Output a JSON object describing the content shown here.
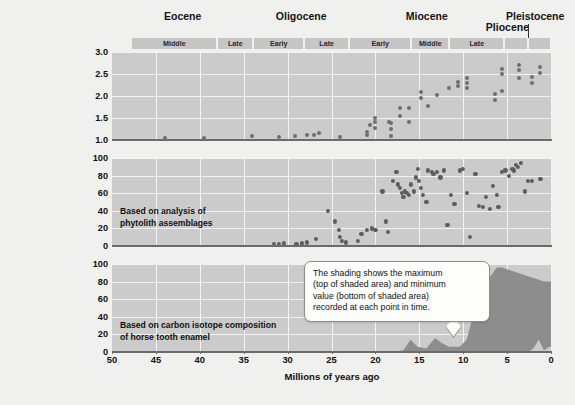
{
  "figure": {
    "xlabel": "Millions of years ago",
    "xticks": [
      "50",
      "45",
      "40",
      "35",
      "30",
      "25",
      "20",
      "15",
      "10",
      "5",
      "0"
    ],
    "xlim": [
      50,
      0
    ]
  },
  "timeline": {
    "epochs": [
      {
        "name": "Eocene",
        "start": 50,
        "end": 33.9
      },
      {
        "name": "Oligocene",
        "start": 33.9,
        "end": 23.0
      },
      {
        "name": "Miocene",
        "start": 23.0,
        "end": 5.3
      },
      {
        "name": "Pliocene",
        "start": 5.3,
        "end": 2.6
      },
      {
        "name": "Pleistocene",
        "start": 2.6,
        "end": 0
      }
    ],
    "subepochs": [
      {
        "label": "Middle",
        "start": 47.8,
        "end": 38.0
      },
      {
        "label": "Late",
        "start": 38.0,
        "end": 33.9
      },
      {
        "label": "Early",
        "start": 33.9,
        "end": 28.1
      },
      {
        "label": "Late",
        "start": 28.1,
        "end": 23.0
      },
      {
        "label": "Early",
        "start": 23.0,
        "end": 15.9
      },
      {
        "label": "Middle",
        "start": 15.9,
        "end": 11.6
      },
      {
        "label": "Late",
        "start": 11.6,
        "end": 5.3
      },
      {
        "label": "",
        "start": 5.3,
        "end": 2.6
      },
      {
        "label": "",
        "start": 2.6,
        "end": 0
      }
    ]
  },
  "callout": {
    "text": "The shading shows the maximum\n(top of shaded area) and minimum\nvalue (bottom of shaded area)\nrecorded at each point in time."
  },
  "chart_data": [
    {
      "type": "scatter",
      "id": "hypsodonty",
      "title": "",
      "ylabel": "Relative importance\nof high-crowned teeth",
      "xlabel": "Millions of years ago",
      "yticks": [
        "1.0",
        "1.5",
        "2.0",
        "2.5",
        "3.0"
      ],
      "ylim": [
        1.0,
        3.0
      ],
      "xlim": [
        50,
        0
      ],
      "grid": true,
      "points": [
        [
          44.0,
          1.05
        ],
        [
          39.5,
          1.05
        ],
        [
          34.0,
          1.08
        ],
        [
          31.0,
          1.07
        ],
        [
          29.2,
          1.1
        ],
        [
          27.8,
          1.12
        ],
        [
          27.0,
          1.12
        ],
        [
          26.4,
          1.15
        ],
        [
          24.0,
          1.07
        ],
        [
          20.6,
          1.35
        ],
        [
          18.4,
          1.42
        ],
        [
          21.0,
          1.12
        ],
        [
          21.0,
          1.18
        ],
        [
          20.0,
          1.5
        ],
        [
          20.0,
          1.4
        ],
        [
          20.0,
          1.28
        ],
        [
          18.2,
          1.1
        ],
        [
          18.2,
          1.25
        ],
        [
          18.2,
          1.38
        ],
        [
          17.2,
          1.55
        ],
        [
          17.2,
          1.72
        ],
        [
          16.2,
          1.42
        ],
        [
          16.2,
          1.72
        ],
        [
          14.8,
          1.95
        ],
        [
          14.8,
          2.1
        ],
        [
          14.0,
          1.78
        ],
        [
          13.0,
          2.02
        ],
        [
          11.6,
          2.18
        ],
        [
          10.6,
          2.22
        ],
        [
          10.6,
          2.32
        ],
        [
          9.6,
          2.18
        ],
        [
          9.6,
          2.3
        ],
        [
          9.6,
          2.4
        ],
        [
          6.4,
          1.92
        ],
        [
          6.4,
          2.05
        ],
        [
          5.6,
          2.5
        ],
        [
          5.6,
          2.62
        ],
        [
          5.6,
          2.12
        ],
        [
          3.6,
          2.42
        ],
        [
          3.6,
          2.58
        ],
        [
          3.6,
          2.7
        ],
        [
          2.2,
          2.3
        ],
        [
          2.2,
          2.44
        ],
        [
          1.2,
          2.52
        ],
        [
          1.2,
          2.66
        ]
      ]
    },
    {
      "type": "scatter",
      "id": "open-habitat-grasses",
      "title": "",
      "ylabel": "Percent of grass\nspecies that live\nin open habitat",
      "xlabel": "Millions of years ago",
      "note": "Based on analysis of\nphytolith assemblages",
      "yticks": [
        "0",
        "20",
        "40",
        "60",
        "80",
        "100"
      ],
      "ylim": [
        0,
        100
      ],
      "xlim": [
        50,
        0
      ],
      "grid": true,
      "points": [
        [
          31.6,
          2
        ],
        [
          31.0,
          2
        ],
        [
          30.4,
          3
        ],
        [
          29.0,
          2
        ],
        [
          28.4,
          3
        ],
        [
          27.8,
          4
        ],
        [
          26.8,
          8
        ],
        [
          25.4,
          40
        ],
        [
          24.6,
          28
        ],
        [
          24.2,
          18
        ],
        [
          24.0,
          10
        ],
        [
          23.8,
          6
        ],
        [
          23.4,
          4
        ],
        [
          22.0,
          6
        ],
        [
          21.6,
          14
        ],
        [
          21.0,
          18
        ],
        [
          20.4,
          20
        ],
        [
          20.0,
          18
        ],
        [
          19.2,
          62
        ],
        [
          18.8,
          28
        ],
        [
          18.6,
          16
        ],
        [
          18.0,
          74
        ],
        [
          17.6,
          84
        ],
        [
          17.4,
          70
        ],
        [
          17.2,
          66
        ],
        [
          17.0,
          60
        ],
        [
          16.8,
          56
        ],
        [
          16.6,
          62
        ],
        [
          16.4,
          60
        ],
        [
          16.2,
          58
        ],
        [
          16.0,
          70
        ],
        [
          15.6,
          62
        ],
        [
          15.4,
          78
        ],
        [
          15.2,
          88
        ],
        [
          15.0,
          74
        ],
        [
          14.8,
          66
        ],
        [
          14.6,
          58
        ],
        [
          14.2,
          50
        ],
        [
          14.0,
          86
        ],
        [
          13.6,
          84
        ],
        [
          13.4,
          82
        ],
        [
          13.0,
          84
        ],
        [
          12.6,
          78
        ],
        [
          12.2,
          86
        ],
        [
          11.8,
          24
        ],
        [
          11.4,
          58
        ],
        [
          11.0,
          48
        ],
        [
          10.4,
          86
        ],
        [
          10.0,
          88
        ],
        [
          9.6,
          60
        ],
        [
          9.2,
          10
        ],
        [
          8.6,
          82
        ],
        [
          8.2,
          46
        ],
        [
          7.8,
          44
        ],
        [
          7.4,
          56
        ],
        [
          7.0,
          42
        ],
        [
          6.6,
          68
        ],
        [
          6.2,
          58
        ],
        [
          6.0,
          44
        ],
        [
          5.6,
          84
        ],
        [
          5.2,
          86
        ],
        [
          4.8,
          80
        ],
        [
          4.4,
          88
        ],
        [
          4.2,
          86
        ],
        [
          4.0,
          92
        ],
        [
          3.8,
          90
        ],
        [
          3.4,
          94
        ],
        [
          3.0,
          62
        ],
        [
          2.6,
          74
        ],
        [
          2.2,
          74
        ],
        [
          1.2,
          76
        ]
      ]
    },
    {
      "type": "area",
      "id": "c4-diet",
      "title": "",
      "ylabel": "Percent of diet\nthat is C₄ plants",
      "xlabel": "Millions of years ago",
      "note": "Based on carbon isotope composition\nof horse tooth enamel",
      "yticks": [
        "0",
        "20",
        "40",
        "60",
        "80",
        "100"
      ],
      "ylim": [
        0,
        100
      ],
      "xlim": [
        50,
        0
      ],
      "grid": true,
      "max_series": [
        [
          18.0,
          0
        ],
        [
          16.8,
          2
        ],
        [
          16.0,
          14
        ],
        [
          15.2,
          6
        ],
        [
          14.2,
          4
        ],
        [
          13.2,
          16
        ],
        [
          12.4,
          10
        ],
        [
          11.6,
          6
        ],
        [
          10.4,
          6
        ],
        [
          9.6,
          14
        ],
        [
          8.8,
          44
        ],
        [
          8.4,
          76
        ],
        [
          8.0,
          86
        ],
        [
          7.4,
          92
        ],
        [
          7.0,
          84
        ],
        [
          6.6,
          90
        ],
        [
          6.2,
          96
        ],
        [
          5.6,
          96
        ],
        [
          5.0,
          94
        ],
        [
          4.4,
          92
        ],
        [
          3.8,
          90
        ],
        [
          3.2,
          88
        ],
        [
          2.6,
          86
        ],
        [
          2.0,
          84
        ],
        [
          1.4,
          82
        ],
        [
          0.8,
          80
        ],
        [
          0.2,
          80
        ],
        [
          0.0,
          80
        ]
      ],
      "min_series": [
        [
          18.0,
          0
        ],
        [
          16.8,
          0
        ],
        [
          16.0,
          0
        ],
        [
          15.2,
          0
        ],
        [
          14.2,
          0
        ],
        [
          13.2,
          0
        ],
        [
          12.4,
          0
        ],
        [
          11.6,
          0
        ],
        [
          10.4,
          0
        ],
        [
          9.6,
          0
        ],
        [
          8.8,
          0
        ],
        [
          8.4,
          0
        ],
        [
          8.0,
          0
        ],
        [
          7.4,
          0
        ],
        [
          7.0,
          0
        ],
        [
          6.6,
          0
        ],
        [
          6.2,
          0
        ],
        [
          5.6,
          0
        ],
        [
          5.0,
          0
        ],
        [
          4.4,
          0
        ],
        [
          3.8,
          0
        ],
        [
          3.2,
          0
        ],
        [
          2.6,
          0
        ],
        [
          2.0,
          4
        ],
        [
          1.4,
          14
        ],
        [
          0.8,
          2
        ],
        [
          0.2,
          6
        ],
        [
          0.0,
          6
        ]
      ],
      "shade_color": "#8d8d8d"
    }
  ]
}
